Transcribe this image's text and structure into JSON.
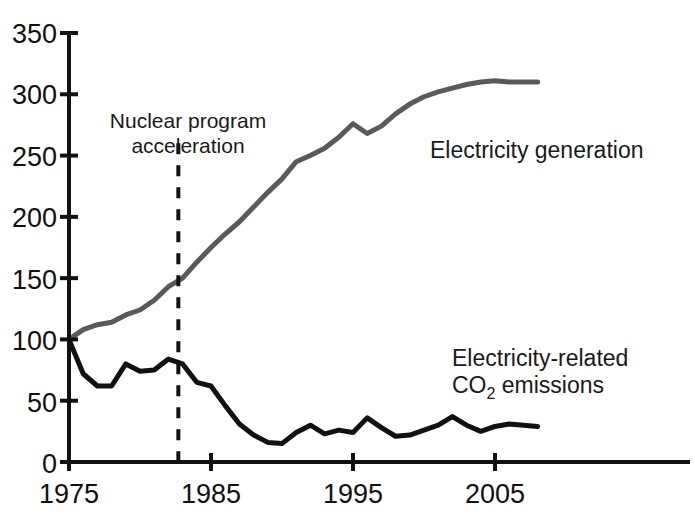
{
  "chart_data": {
    "type": "line",
    "title": "",
    "subtitle": "",
    "xlabel": "",
    "ylabel": "",
    "xlim": [
      1975,
      2008
    ],
    "ylim": [
      0,
      350
    ],
    "grid": false,
    "legend_position": "inline-annotations",
    "x_ticks": [
      "1975",
      "1985",
      "1995",
      "2005"
    ],
    "x_tick_values": [
      1975,
      1985,
      1995,
      2005
    ],
    "y_ticks": [
      "0",
      "50",
      "100",
      "150",
      "200",
      "250",
      "300",
      "350"
    ],
    "y_tick_values": [
      0,
      50,
      100,
      150,
      200,
      250,
      300,
      350
    ],
    "x": [
      1975,
      1976,
      1977,
      1978,
      1979,
      1980,
      1981,
      1982,
      1983,
      1984,
      1985,
      1986,
      1987,
      1988,
      1989,
      1990,
      1991,
      1992,
      1993,
      1994,
      1995,
      1996,
      1997,
      1998,
      1999,
      2000,
      2001,
      2002,
      2003,
      2004,
      2005,
      2006,
      2007,
      2008
    ],
    "series": [
      {
        "name": "Electricity generation",
        "color": "#5a5a5a",
        "line_width": 5,
        "style": "solid",
        "values": [
          100,
          108,
          112,
          114,
          120,
          124,
          132,
          143,
          150,
          163,
          175,
          186,
          196,
          208,
          220,
          231,
          245,
          250,
          256,
          265,
          276,
          268,
          274,
          284,
          292,
          298,
          302,
          305,
          308,
          310,
          311,
          310,
          310,
          310
        ]
      },
      {
        "name": "Electricity-related CO2 emissions",
        "color": "#111111",
        "line_width": 5,
        "style": "solid",
        "values": [
          100,
          72,
          62,
          62,
          80,
          74,
          75,
          84,
          80,
          65,
          62,
          46,
          31,
          22,
          16,
          15,
          24,
          30,
          23,
          26,
          24,
          36,
          28,
          21,
          22,
          26,
          30,
          37,
          30,
          25,
          29,
          31,
          30,
          29
        ]
      }
    ],
    "annotations": [
      {
        "name": "nuclear-program-acceleration",
        "text_lines": [
          "Nuclear program",
          "acceleration"
        ],
        "marker_type": "dashed-vertical-line",
        "x_value": 1982.7,
        "y_top": 260,
        "y_bottom": 0,
        "color": "#111111"
      }
    ],
    "series_inline_labels": [
      {
        "name": "electricity-generation-label",
        "text": "Electricity generation",
        "x_value": 1999.5,
        "y_value": 250
      },
      {
        "name": "co2-emissions-label",
        "line1": "Electricity-related",
        "line2_prefix": "CO",
        "line2_subscript": "2",
        "line2_suffix": " emissions",
        "x_value": 2001,
        "y_value": 95
      }
    ]
  },
  "axis": {
    "y_tick_0": "0",
    "y_tick_50": "50",
    "y_tick_100": "100",
    "y_tick_150": "150",
    "y_tick_200": "200",
    "y_tick_250": "250",
    "y_tick_300": "300",
    "y_tick_350": "350",
    "x_tick_1975": "1975",
    "x_tick_1985": "1985",
    "x_tick_1995": "1995",
    "x_tick_2005": "2005"
  },
  "labels": {
    "annotation_line1": "Nuclear program",
    "annotation_line2": "acceleration",
    "series_generation": "Electricity generation",
    "series_co2_line1": "Electricity-related",
    "series_co2_line2_prefix": "CO",
    "series_co2_line2_sub": "2",
    "series_co2_line2_suffix": " emissions"
  },
  "colors": {
    "generation_line": "#5a5a5a",
    "co2_line": "#111111",
    "axis": "#111111",
    "background": "#ffffff"
  }
}
